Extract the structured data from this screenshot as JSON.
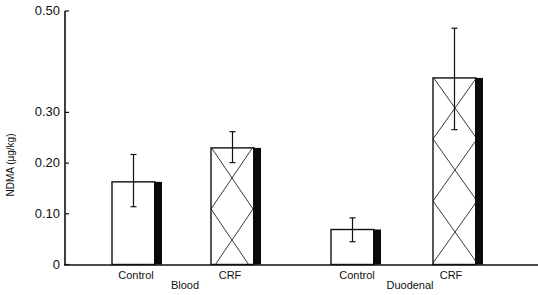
{
  "chart_data": {
    "type": "bar",
    "title": "",
    "xlabel": "",
    "ylabel": "NDMA (µg/kg)",
    "ylim": [
      0,
      0.5
    ],
    "yticks": [
      0,
      0.1,
      0.2,
      0.3,
      0.5
    ],
    "ytick_labels": [
      "0",
      "0.10",
      "0.20",
      "0.30",
      "0.50"
    ],
    "grid": false,
    "legend": null,
    "groups": [
      "Blood",
      "Duodenal"
    ],
    "categories": [
      "Control",
      "CRF",
      "Control",
      "CRF"
    ],
    "category_groups": [
      "Blood",
      "Blood",
      "Duodenal",
      "Duodenal"
    ],
    "values": [
      0.163,
      0.23,
      0.069,
      0.368
    ],
    "error_upper": [
      0.217,
      0.262,
      0.092,
      0.466
    ],
    "error_lower": [
      0.114,
      0.201,
      0.045,
      0.266
    ],
    "patterns": [
      "plain",
      "crosshatch",
      "plain",
      "crosshatch"
    ]
  }
}
